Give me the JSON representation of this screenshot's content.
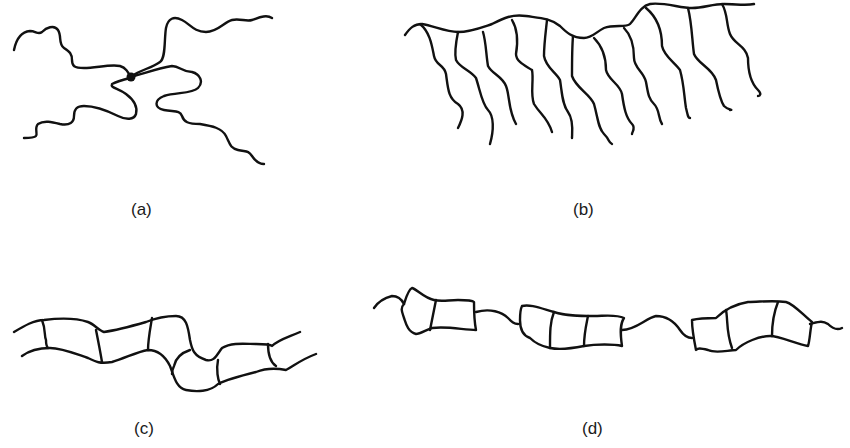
{
  "figure": {
    "panels": [
      {
        "id": "a",
        "label": "(a)",
        "structure": "star"
      },
      {
        "id": "b",
        "label": "(b)",
        "structure": "comb"
      },
      {
        "id": "c",
        "label": "(c)",
        "structure": "ladder"
      },
      {
        "id": "d",
        "label": "(d)",
        "structure": "ladder-blocks-with-linear-segments"
      }
    ],
    "colors": {
      "line": "#111111",
      "background": "#ffffff"
    }
  }
}
